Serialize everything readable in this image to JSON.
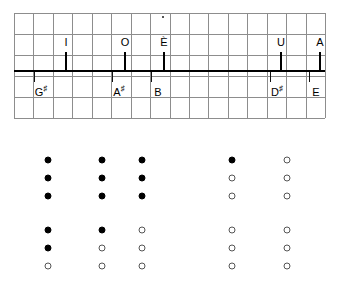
{
  "chart_data": {
    "type": "scatter",
    "title": "",
    "xlabel": "",
    "ylabel": "",
    "grid": true,
    "grid_columns": 16,
    "grid_rows": 5,
    "axis_line": {
      "y_fraction": 0.545,
      "x_start_fraction": 0.0,
      "x_end_fraction": 1.0
    },
    "vowel_markers": [
      {
        "label": "I",
        "x": 51,
        "direction": "up"
      },
      {
        "label": "O",
        "x": 110,
        "direction": "up"
      },
      {
        "label": "È",
        "x": 149,
        "direction": "up"
      },
      {
        "label": "U",
        "x": 266,
        "direction": "up"
      },
      {
        "label": "A",
        "x": 305,
        "direction": "up"
      }
    ],
    "note_markers": [
      {
        "label": "G",
        "accidental": "♯",
        "x": 20,
        "direction": "down"
      },
      {
        "label": "A",
        "accidental": "♯",
        "x": 98,
        "direction": "down"
      },
      {
        "label": "B",
        "accidental": "",
        "x": 137,
        "direction": "down"
      },
      {
        "label": "D",
        "accidental": "♯",
        "x": 256,
        "direction": "down"
      },
      {
        "label": "E",
        "accidental": "",
        "x": 295,
        "direction": "down"
      }
    ],
    "dot_matrix": {
      "marker_types": [
        "filled",
        "open"
      ],
      "blocks": [
        {
          "name": "upper-block",
          "columns_x": [
            48,
            102,
            142,
            232,
            287
          ],
          "rows_y": [
            20,
            38,
            56
          ],
          "values": [
            [
              "filled",
              "filled",
              "filled",
              "filled",
              "open"
            ],
            [
              "filled",
              "filled",
              "filled",
              "open",
              "open"
            ],
            [
              "filled",
              "filled",
              "filled",
              "open",
              "open"
            ]
          ]
        },
        {
          "name": "lower-block",
          "columns_x": [
            48,
            102,
            142,
            232,
            287
          ],
          "rows_y": [
            90,
            108,
            126
          ],
          "values": [
            [
              "filled",
              "filled",
              "open",
              "open",
              "open"
            ],
            [
              "filled",
              "open",
              "open",
              "open",
              "open"
            ],
            [
              "open",
              "open",
              "open",
              "open",
              "open"
            ]
          ]
        }
      ]
    },
    "colors": {
      "grid": "#8d8d8d",
      "axis": "#000000",
      "filled_dot": "#000000",
      "open_dot_border": "#555555",
      "background": "#ffffff"
    }
  }
}
